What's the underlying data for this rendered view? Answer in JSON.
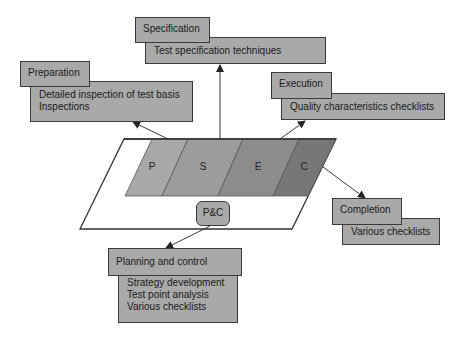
{
  "diagram": {
    "segments": [
      {
        "id": "P",
        "label": "P",
        "color": "#a8a8a8"
      },
      {
        "id": "S",
        "label": "S",
        "color": "#9c9c9c"
      },
      {
        "id": "E",
        "label": "E",
        "color": "#8c8c8c"
      },
      {
        "id": "C",
        "label": "C",
        "color": "#777777"
      }
    ],
    "center_badge": "P&C",
    "phases": {
      "preparation": {
        "title": "Preparation",
        "items": [
          "Detailed inspection of test basis",
          "Inspections"
        ]
      },
      "specification": {
        "title": "Specification",
        "items": [
          "Test specification techniques"
        ]
      },
      "execution": {
        "title": "Execution",
        "items": [
          "Quality characteristics checklists"
        ]
      },
      "completion": {
        "title": "Completion",
        "items": [
          "Various checklists"
        ]
      },
      "planning": {
        "title": "Planning and control",
        "items": [
          "Strategy development",
          "Test point analysis",
          "Various checklists"
        ]
      }
    },
    "colors": {
      "box_fill": "#a9a9a9",
      "border": "#3a3a3a",
      "background": "#ffffff"
    }
  }
}
